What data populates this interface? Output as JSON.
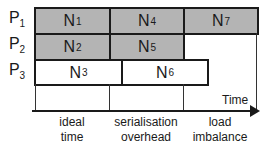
{
  "processors": [
    {
      "label": "P",
      "sub": "1"
    },
    {
      "label": "P",
      "sub": "2"
    },
    {
      "label": "P",
      "sub": "3"
    }
  ],
  "tasks": [
    {
      "label": "N",
      "sub": "1",
      "processor": "P1",
      "state": "busy"
    },
    {
      "label": "N",
      "sub": "4",
      "processor": "P1",
      "state": "busy"
    },
    {
      "label": "N",
      "sub": "7",
      "processor": "P1",
      "state": "busy"
    },
    {
      "label": "N",
      "sub": "2",
      "processor": "P2",
      "state": "busy"
    },
    {
      "label": "N",
      "sub": "5",
      "processor": "P2",
      "state": "busy"
    },
    {
      "label": "N",
      "sub": "3",
      "processor": "P3",
      "state": "free"
    },
    {
      "label": "N",
      "sub": "6",
      "processor": "P3",
      "state": "free"
    }
  ],
  "axis": {
    "label": "Time"
  },
  "categories": [
    {
      "line1": "ideal",
      "line2": "time"
    },
    {
      "line1": "serialisation",
      "line2": "overhead"
    },
    {
      "line1": "load",
      "line2": "imbalance"
    }
  ],
  "colors": {
    "busy_fill": "#b4b4b4",
    "free_fill": "#ffffff",
    "stroke": "#1a1a1a"
  }
}
